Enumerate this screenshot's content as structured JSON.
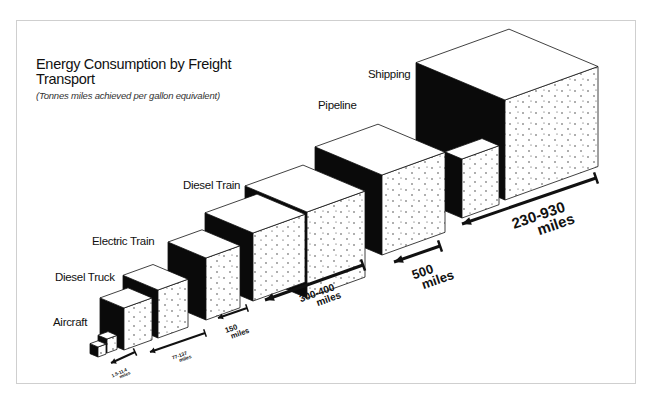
{
  "title": "Energy Consumption by Freight Transport",
  "subtitle": "(Tonnes miles achieved per gallon equivalent)",
  "chart_data": {
    "type": "isometric-cube-comparison",
    "title": "Energy Consumption by Freight Transport",
    "subtitle": "(Tonnes miles achieved per gallon equivalent)",
    "unit": "tonne miles per gallon equivalent",
    "categories": [
      "Aircraft",
      "Diesel Truck",
      "Electric Train",
      "Diesel Train",
      "Pipeline",
      "Shipping"
    ],
    "ranges": [
      {
        "mode": "Aircraft",
        "label": "1.5-11.4 miles",
        "min": 1.5,
        "max": 11.4
      },
      {
        "mode": "Diesel Truck",
        "label": "77-137 miles",
        "min": 77,
        "max": 137
      },
      {
        "mode": "Electric Train",
        "label": "150 miles",
        "min": 150,
        "max": 150
      },
      {
        "mode": "Diesel Train",
        "label": "300-400 miles",
        "min": 300,
        "max": 400
      },
      {
        "mode": "Pipeline",
        "label": "500 miles",
        "min": 500,
        "max": 500
      },
      {
        "mode": "Shipping",
        "label": "230-930 miles",
        "min": 230,
        "max": 930
      }
    ]
  },
  "modes": [
    {
      "name": "Aircraft",
      "range_value": "1.5-11.4",
      "range_unit": "miles"
    },
    {
      "name": "Diesel Truck",
      "range_value": "77-137",
      "range_unit": "miles"
    },
    {
      "name": "Electric Train",
      "range_value": "150",
      "range_unit": "miles"
    },
    {
      "name": "Diesel Train",
      "range_value": "300-400",
      "range_unit": "miles"
    },
    {
      "name": "Pipeline",
      "range_value": "500",
      "range_unit": "miles"
    },
    {
      "name": "Shipping",
      "range_value": "230-930",
      "range_unit": "miles"
    }
  ],
  "colors": {
    "ink": "#111111",
    "paper": "#ffffff",
    "frame": "#cfcfcf"
  }
}
